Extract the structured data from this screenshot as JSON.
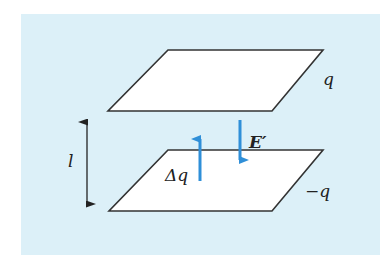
{
  "diagram": {
    "colors": {
      "panel_background": "#dcf0f8",
      "plate_fill": "#ffffff",
      "plate_stroke": "#333333",
      "arrow_blue": "#2f8fd8",
      "dimension_arrow": "#222222"
    },
    "plates": [
      {
        "id": "top-plate",
        "charge_label": "q",
        "points": [
          [
            168,
            50
          ],
          [
            323,
            50
          ],
          [
            272,
            111
          ],
          [
            108,
            111
          ]
        ]
      },
      {
        "id": "bottom-plate",
        "charge_label": "−q",
        "points": [
          [
            168,
            150
          ],
          [
            323,
            150
          ],
          [
            272,
            211
          ],
          [
            109,
            211
          ]
        ]
      }
    ],
    "labels": {
      "separation": "l",
      "top_charge": "q",
      "bottom_charge": "−q",
      "charge_transfer": "Δq",
      "field": "E′"
    },
    "arrows": [
      {
        "id": "charge-transfer-arrow",
        "direction": "up",
        "x": 200,
        "y_from": 181,
        "y_to": 130
      },
      {
        "id": "field-arrow",
        "direction": "down",
        "x": 240,
        "y_from": 120,
        "y_to": 169
      },
      {
        "id": "separation-arrow",
        "direction": "both",
        "x": 87,
        "y_from": 113,
        "y_to": 213
      }
    ]
  }
}
